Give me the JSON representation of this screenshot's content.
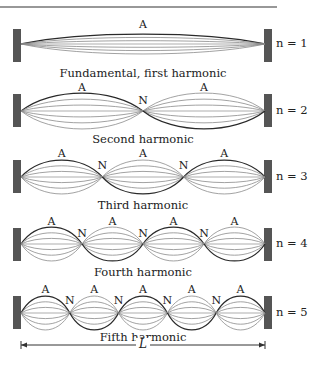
{
  "figure": {
    "top_rule": {
      "x1": 0,
      "x2": 277,
      "y": 7
    },
    "wall_color": "#555555",
    "string_color_dark": "#2a2a2a",
    "string_color_light": "#8a8a8a",
    "string_left_x": 21,
    "string_right_x": 265,
    "dimension": {
      "label": "L",
      "y": 345,
      "x1": 21,
      "x2": 265
    }
  },
  "harmonics": [
    {
      "n": 1,
      "n_label": "n = 1",
      "caption": "Fundamental, first harmonic",
      "center_y": 44,
      "amplitude": 10,
      "wall_top": 29,
      "label_a_y": 19,
      "label_n_y": 0,
      "caption_y": 68,
      "antinode_label": "A",
      "node_label": "N"
    },
    {
      "n": 2,
      "n_label": "n = 2",
      "caption": "Second harmonic",
      "center_y": 111,
      "amplitude": 18,
      "wall_top": 94,
      "label_a_y": 82,
      "label_n_y": 95,
      "caption_y": 134,
      "antinode_label": "A",
      "node_label": "N"
    },
    {
      "n": 3,
      "n_label": "n = 3",
      "caption": "Third harmonic",
      "center_y": 177,
      "amplitude": 17,
      "wall_top": 160,
      "label_a_y": 148,
      "label_n_y": 160,
      "caption_y": 200,
      "antinode_label": "A",
      "node_label": "N"
    },
    {
      "n": 4,
      "n_label": "n = 4",
      "caption": "Fourth harmonic",
      "center_y": 244,
      "amplitude": 17,
      "wall_top": 228,
      "label_a_y": 216,
      "label_n_y": 228,
      "caption_y": 267,
      "antinode_label": "A",
      "node_label": "N"
    },
    {
      "n": 5,
      "n_label": "n = 5",
      "caption": "Fifth harmonic",
      "center_y": 313,
      "amplitude": 17,
      "wall_top": 296,
      "label_a_y": 284,
      "label_n_y": 295,
      "caption_y": 332,
      "antinode_label": "A",
      "node_label": "N"
    }
  ]
}
